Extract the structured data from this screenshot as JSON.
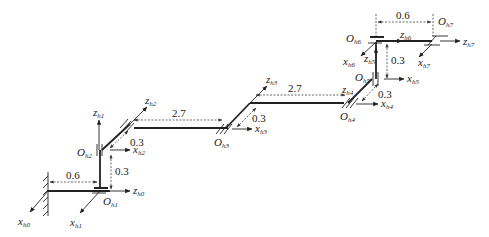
{
  "diagram": {
    "type": "kinematic chain (robot arm frames)",
    "frames": [
      {
        "id": "h0",
        "origin": "",
        "z": "z",
        "z_sub": "h0",
        "x": "x",
        "x_sub": "h0"
      },
      {
        "id": "h1",
        "origin": "O",
        "origin_sub": "h1",
        "z": "z",
        "z_sub": "h1",
        "x": "x",
        "x_sub": "h1"
      },
      {
        "id": "h2",
        "origin": "O",
        "origin_sub": "h2",
        "z": "z",
        "z_sub": "h2",
        "x": "x",
        "x_sub": "h2"
      },
      {
        "id": "h3",
        "origin": "O",
        "origin_sub": "h3",
        "z": "z",
        "z_sub": "h3",
        "x": "x",
        "x_sub": "h3"
      },
      {
        "id": "h4",
        "origin": "O",
        "origin_sub": "h4",
        "z": "z",
        "z_sub": "h4",
        "x": "x",
        "x_sub": "h4"
      },
      {
        "id": "h5",
        "origin": "O",
        "origin_sub": "h5",
        "z": "z",
        "z_sub": "h5",
        "x": "x",
        "x_sub": "h5"
      },
      {
        "id": "h6",
        "origin": "O",
        "origin_sub": "h6",
        "z": "z",
        "z_sub": "h6",
        "x": "x",
        "x_sub": "h6"
      },
      {
        "id": "h7",
        "origin": "O",
        "origin_sub": "h7",
        "z": "z",
        "z_sub": "h7",
        "x": "x",
        "x_sub": "h7"
      }
    ],
    "dimensions": {
      "base_to_h1": "0.6",
      "h1_to_h2": "0.3",
      "h2_offset": "0.3",
      "h2_to_h3": "2.7",
      "h3_offset": "0.3",
      "h3_to_h4": "2.7",
      "h4_offset": "0.3",
      "h5_to_h6": "0.3",
      "h6_to_h7": "0.6"
    }
  }
}
